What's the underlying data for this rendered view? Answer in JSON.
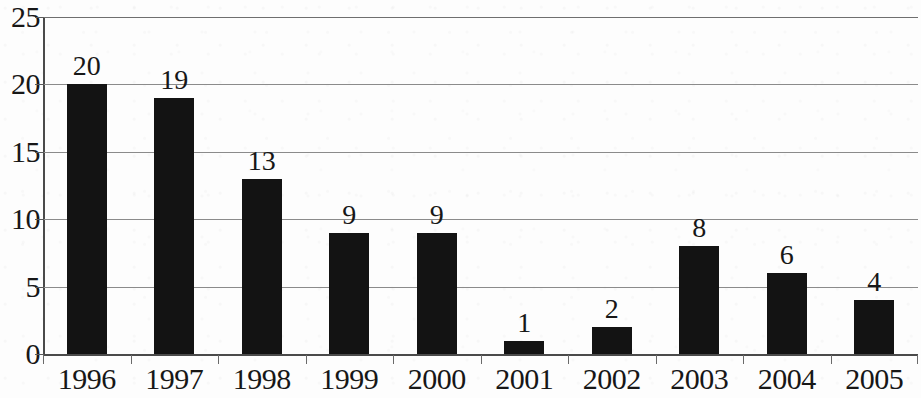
{
  "chart_data": {
    "type": "bar",
    "title": "",
    "subtitle": "",
    "xlabel": "",
    "ylabel": "",
    "categories": [
      "1996",
      "1997",
      "1998",
      "1999",
      "2000",
      "2001",
      "2002",
      "2003",
      "2004",
      "2005"
    ],
    "values": [
      20,
      19,
      13,
      9,
      9,
      1,
      2,
      8,
      6,
      4
    ],
    "data_labels": [
      "20",
      "19",
      "13",
      "9",
      "9",
      "1",
      "2",
      "8",
      "6",
      "4"
    ],
    "ylim": [
      0,
      25
    ],
    "y_ticks": [
      0,
      5,
      10,
      15,
      20,
      25
    ],
    "y_tick_labels": [
      "0",
      "5",
      "10",
      "15",
      "20",
      "25"
    ],
    "grid": true,
    "grid_axis": "y",
    "legend": false,
    "legend_entries": [],
    "annotations": [],
    "bar_color": "#131313",
    "gridline_color": "#8b8b8b",
    "axis_color": "#4a4a4a",
    "background_color": "#fdfdfd",
    "text_color": "#171717"
  }
}
